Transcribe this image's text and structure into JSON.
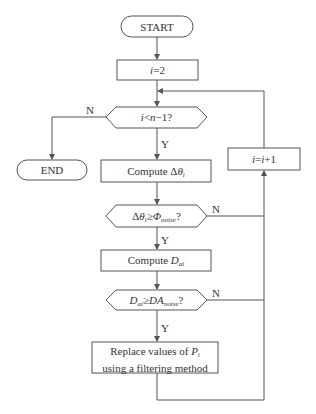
{
  "nodes": {
    "start": {
      "label": "START"
    },
    "init": {
      "var": "i",
      "rest": "=2"
    },
    "cond1": {
      "a": "i",
      "op": "<",
      "b": "n",
      "rest": "−1?"
    },
    "end": {
      "label": "END"
    },
    "compute_theta": {
      "prefix": "Compute Δ",
      "sym": "θ",
      "sub": "i"
    },
    "increment": {
      "a": "i",
      "eq": "=",
      "b": "i",
      "rest": "+1"
    },
    "cond2": {
      "pre": "Δ",
      "sym": "θ",
      "sub": "i",
      "op": "≥",
      "sym2": "Φ",
      "sub2": "noise",
      "q": "?"
    },
    "compute_dai": {
      "prefix": "Compute ",
      "sym": "D",
      "sub": "ai"
    },
    "cond3": {
      "sym": "D",
      "sub": "ai",
      "op": "≥",
      "sym2": "DA",
      "sub2": "noise",
      "q": "?"
    },
    "replace": {
      "line1_prefix": "Replace values of ",
      "line1_sym": "P",
      "line1_sub": "i",
      "line2": "using a filtering method"
    }
  },
  "edges": {
    "yes_label": "Y",
    "no_label": "N"
  },
  "colors": {
    "stroke": "#555555",
    "text": "#333333"
  }
}
